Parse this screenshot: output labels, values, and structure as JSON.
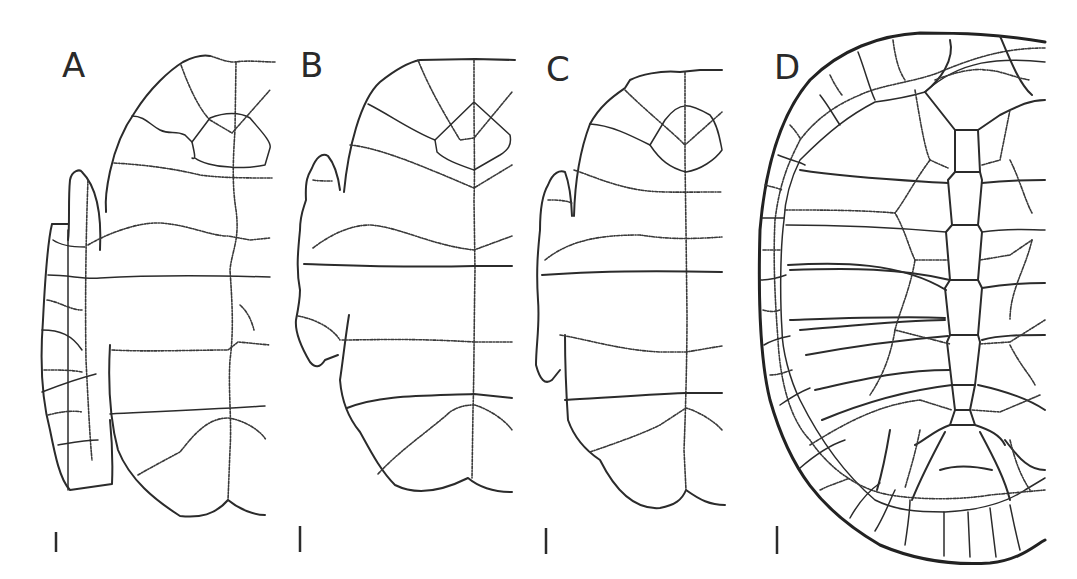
{
  "figure": {
    "panels": [
      {
        "label": "A",
        "name": "panel-a",
        "scale_bar": true
      },
      {
        "label": "B",
        "name": "panel-b",
        "scale_bar": true
      },
      {
        "label": "C",
        "name": "panel-c",
        "scale_bar": true
      },
      {
        "label": "D",
        "name": "panel-d",
        "scale_bar": true
      }
    ],
    "colors": {
      "line": "#2b2b2b",
      "background": "#ffffff"
    }
  }
}
